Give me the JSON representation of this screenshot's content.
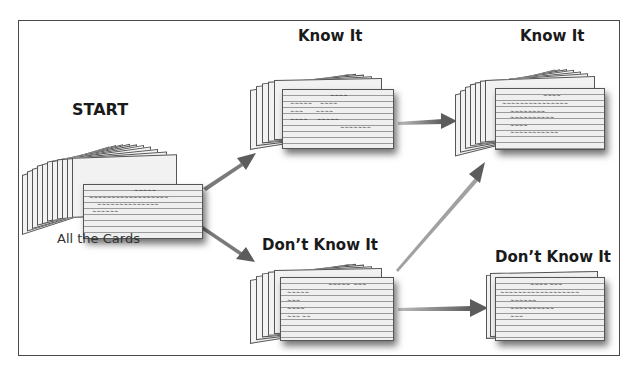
{
  "diagram": {
    "title_start": "START",
    "start_caption": "All the Cards",
    "nodes": [
      {
        "id": "start",
        "label": "START",
        "caption": "All the Cards",
        "card_count": 12
      },
      {
        "id": "know-1",
        "label": "Know It",
        "card_count": 6
      },
      {
        "id": "dont-know-1",
        "label": "Don’t Know It",
        "card_count": 6
      },
      {
        "id": "know-2",
        "label": "Know It",
        "card_count": 10
      },
      {
        "id": "dont-know-2",
        "label": "Don’t Know It",
        "card_count": 3
      }
    ],
    "edges": [
      {
        "from": "start",
        "to": "know-1"
      },
      {
        "from": "start",
        "to": "dont-know-1"
      },
      {
        "from": "know-1",
        "to": "know-2"
      },
      {
        "from": "dont-know-1",
        "to": "know-2"
      },
      {
        "from": "dont-know-1",
        "to": "dont-know-2"
      }
    ],
    "colors": {
      "frame": "#4a4a4a",
      "arrow": "#6e6e6e",
      "card": "#efefef",
      "card_rule": "#9a9a9a",
      "text": "#1a1a1a"
    }
  }
}
